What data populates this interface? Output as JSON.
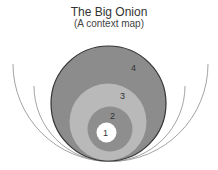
{
  "title": "The Big Onion",
  "subtitle": "(A context map)",
  "layers": [
    {
      "label": "1",
      "fill": "#ffffff"
    },
    {
      "label": "2",
      "fill": "#8e8e8e"
    },
    {
      "label": "3",
      "fill": "#b9b9b9"
    },
    {
      "label": "4",
      "fill": "#8c8c8c"
    }
  ],
  "colors": {
    "outline": "#333333",
    "arc": "#999999"
  }
}
